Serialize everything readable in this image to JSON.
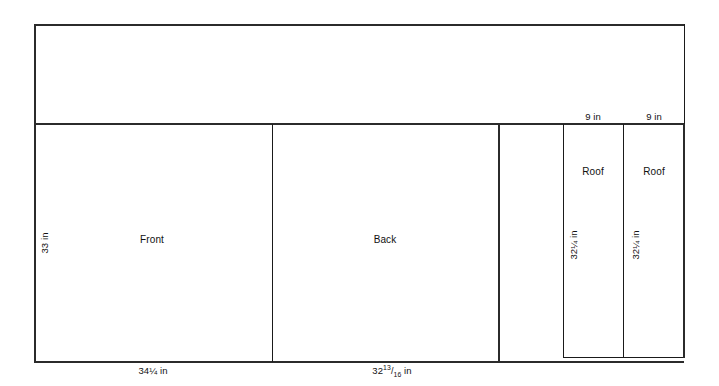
{
  "diagram": {
    "type": "cut-layout",
    "units": "in",
    "stock_sheet": {
      "name": "stock-sheet-outline",
      "description": "outer rectangular sheet boundary"
    },
    "pieces": [
      {
        "id": "front",
        "label": "Front",
        "width_label": "34",
        "width_fraction_whole": "34",
        "width_fraction_num": "1",
        "width_fraction_den": "4",
        "width_text": "34¼ in",
        "height_text": "33 in",
        "height_label": "33 in"
      },
      {
        "id": "back",
        "label": "Back",
        "width_whole": "32",
        "width_num": "13",
        "width_den": "16",
        "width_unit": "in",
        "width_text": "32¹³⁄₁₆ in"
      },
      {
        "id": "roof-left",
        "label": "Roof",
        "width_text": "9 in",
        "height_whole": "32",
        "height_frac": "¼",
        "height_unit": "in",
        "height_text": "32¼ in"
      },
      {
        "id": "roof-right",
        "label": "Roof",
        "width_text": "9 in",
        "height_whole": "32",
        "height_frac": "¼",
        "height_unit": "in",
        "height_text": "32¼ in"
      }
    ],
    "labels": {
      "front_name": "Front",
      "back_name": "Back",
      "roof_left_name": "Roof",
      "roof_right_name": "Roof",
      "front_height": "33 in",
      "roof_left_width": "9 in",
      "roof_right_width": "9 in",
      "unit_suffix": "in",
      "front_width_whole": "34",
      "back_width_whole": "32",
      "back_width_num": "13",
      "back_width_den": "16",
      "roof_left_height_whole": "32",
      "roof_right_height_whole": "32"
    },
    "colors": {
      "line": "#1a1a1a",
      "line_heavy": "#2b2b2b",
      "background": "#ffffff",
      "text": "#111111"
    }
  }
}
